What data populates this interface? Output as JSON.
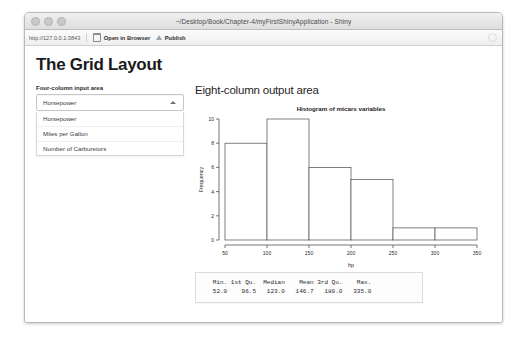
{
  "window": {
    "title": "~/Desktop/Book/Chapter-4/myFirstShinyApplication - Shiny",
    "traffic_lights": [
      "close",
      "minimize",
      "zoom"
    ]
  },
  "toolbar": {
    "url": "http://127.0.0.1:3843",
    "open_in_browser_label": "Open in Browser",
    "publish_label": "Publish"
  },
  "page": {
    "heading": "The Grid Layout",
    "left_column": {
      "label": "Four-column input area",
      "select": {
        "value": "Horsepower",
        "expanded": true,
        "options": [
          "Horsepower",
          "Miles per Gallon",
          "Number of Carburetors"
        ]
      }
    },
    "right_column": {
      "heading": "Eight-column output area"
    },
    "summary": {
      "headers": [
        "Min.",
        "1st Qu.",
        "Median",
        "Mean",
        "3rd Qu.",
        "Max."
      ],
      "values": [
        "52.0",
        "96.5",
        "123.0",
        "146.7",
        "180.0",
        "335.0"
      ],
      "text_line_1": "   Min. 1st Qu.  Median    Mean 3rd Qu.    Max.",
      "text_line_2": "   52.0    96.5   123.0   146.7   180.0   335.0"
    }
  },
  "chart_data": {
    "type": "bar",
    "title": "Histogram of mtcars variables",
    "xlabel": "hp",
    "ylabel": "Frequency",
    "categories": [
      "50-100",
      "100-150",
      "150-200",
      "200-250",
      "250-300",
      "300-350"
    ],
    "bin_edges": [
      50,
      100,
      150,
      200,
      250,
      300,
      350
    ],
    "values": [
      8,
      10,
      6,
      5,
      1,
      1
    ],
    "xlim": [
      50,
      350
    ],
    "ylim": [
      0,
      10
    ],
    "xticks": [
      50,
      100,
      150,
      200,
      250,
      300,
      350
    ],
    "yticks": [
      0,
      2,
      4,
      6,
      8,
      10
    ],
    "grid": false,
    "legend": "none",
    "bar_fill": "#ffffff",
    "bar_stroke": "#4a4a4a"
  }
}
